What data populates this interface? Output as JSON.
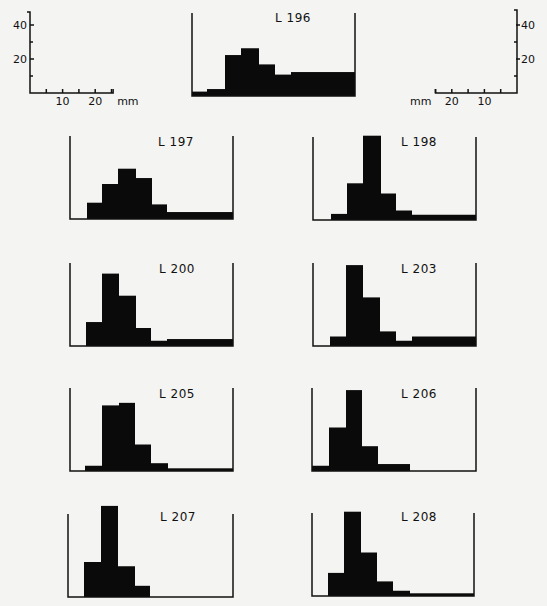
{
  "chart_data": {
    "type": "bar",
    "bin_width_mm": 5,
    "y_unit_px": 1.7,
    "scales": {
      "left": {
        "y_ticks": [
          {
            "value": 40,
            "label": "40"
          },
          {
            "value": 20,
            "label": "20"
          }
        ],
        "y_minor": [
          10,
          30
        ],
        "x_ticks": [
          {
            "value": 10,
            "label": "10"
          },
          {
            "value": 20,
            "label": "20"
          }
        ],
        "x_minor": [
          5,
          15,
          25
        ],
        "x_unit": "mm"
      },
      "right": {
        "y_ticks": [
          {
            "value": 40,
            "label": "40"
          },
          {
            "value": 20,
            "label": "20"
          }
        ],
        "y_minor": [
          10,
          30
        ],
        "x_ticks": [
          {
            "value": 10,
            "label": "10"
          },
          {
            "value": 20,
            "label": "20"
          }
        ],
        "x_minor": [
          5,
          15,
          25
        ],
        "x_unit": "mm"
      }
    },
    "panels": [
      {
        "label": "L 196",
        "frame": [
          192,
          355
        ],
        "baseline": 95,
        "label_xy": [
          275,
          22
        ],
        "bars": [
          {
            "x0": 192,
            "x1": 207,
            "v": 2
          },
          {
            "x0": 207,
            "x1": 225,
            "v": 3.5
          },
          {
            "x0": 225,
            "x1": 241,
            "v": 23.5
          },
          {
            "x0": 241,
            "x1": 259,
            "v": 27.5
          },
          {
            "x0": 259,
            "x1": 275,
            "v": 18
          },
          {
            "x0": 275,
            "x1": 291,
            "v": 12
          },
          {
            "x0": 291,
            "x1": 355,
            "v": 13.5
          }
        ]
      },
      {
        "label": "L 197",
        "frame": [
          70,
          233
        ],
        "baseline": 218,
        "label_xy": [
          158,
          146
        ],
        "bars": [
          {
            "x0": 87,
            "x1": 102,
            "v": 9
          },
          {
            "x0": 102,
            "x1": 118,
            "v": 20
          },
          {
            "x0": 118,
            "x1": 136,
            "v": 29
          },
          {
            "x0": 136,
            "x1": 152,
            "v": 23.5
          },
          {
            "x0": 152,
            "x1": 167,
            "v": 8
          },
          {
            "x0": 167,
            "x1": 233,
            "v": 3.5
          }
        ]
      },
      {
        "label": "L 198",
        "frame": [
          313,
          476
        ],
        "baseline": 219,
        "label_xy": [
          401,
          146
        ],
        "bars": [
          {
            "x0": 331,
            "x1": 347,
            "v": 3
          },
          {
            "x0": 347,
            "x1": 363,
            "v": 21
          },
          {
            "x0": 363,
            "x1": 381,
            "v": 49
          },
          {
            "x0": 381,
            "x1": 396,
            "v": 15
          },
          {
            "x0": 396,
            "x1": 412,
            "v": 5
          },
          {
            "x0": 412,
            "x1": 476,
            "v": 2.5
          }
        ]
      },
      {
        "label": "L 200",
        "frame": [
          70,
          233
        ],
        "baseline": 345,
        "label_xy": [
          159,
          273
        ],
        "bars": [
          {
            "x0": 86,
            "x1": 102,
            "v": 13.5
          },
          {
            "x0": 102,
            "x1": 119,
            "v": 42
          },
          {
            "x0": 119,
            "x1": 136,
            "v": 29
          },
          {
            "x0": 136,
            "x1": 151,
            "v": 10
          },
          {
            "x0": 151,
            "x1": 167,
            "v": 2.5
          },
          {
            "x0": 167,
            "x1": 233,
            "v": 3.5
          }
        ]
      },
      {
        "label": "L 203",
        "frame": [
          313,
          476
        ],
        "baseline": 345,
        "label_xy": [
          401,
          273
        ],
        "bars": [
          {
            "x0": 330,
            "x1": 346,
            "v": 5
          },
          {
            "x0": 346,
            "x1": 363,
            "v": 47
          },
          {
            "x0": 363,
            "x1": 380,
            "v": 28
          },
          {
            "x0": 380,
            "x1": 396,
            "v": 8
          },
          {
            "x0": 396,
            "x1": 412,
            "v": 2.5
          },
          {
            "x0": 412,
            "x1": 476,
            "v": 5
          }
        ]
      },
      {
        "label": "L 205",
        "frame": [
          70,
          233
        ],
        "baseline": 470,
        "label_xy": [
          159,
          398
        ],
        "bars": [
          {
            "x0": 85,
            "x1": 102,
            "v": 2.5
          },
          {
            "x0": 102,
            "x1": 119,
            "v": 38
          },
          {
            "x0": 119,
            "x1": 135,
            "v": 39.5
          },
          {
            "x0": 135,
            "x1": 151,
            "v": 15
          },
          {
            "x0": 151,
            "x1": 168,
            "v": 4
          },
          {
            "x0": 168,
            "x1": 233,
            "v": 1
          }
        ]
      },
      {
        "label": "L 206",
        "frame": [
          312,
          476
        ],
        "baseline": 470,
        "label_xy": [
          401,
          398
        ],
        "bars": [
          {
            "x0": 312,
            "x1": 329,
            "v": 2.5
          },
          {
            "x0": 329,
            "x1": 346,
            "v": 25
          },
          {
            "x0": 346,
            "x1": 362,
            "v": 47
          },
          {
            "x0": 362,
            "x1": 378,
            "v": 14
          },
          {
            "x0": 378,
            "x1": 410,
            "v": 3.5
          }
        ]
      },
      {
        "label": "L 207",
        "frame": [
          68,
          233
        ],
        "baseline": 596,
        "label_xy": [
          160,
          521
        ],
        "bars": [
          {
            "x0": 84,
            "x1": 101,
            "v": 20
          },
          {
            "x0": 101,
            "x1": 118,
            "v": 53
          },
          {
            "x0": 118,
            "x1": 135,
            "v": 17.5
          },
          {
            "x0": 135,
            "x1": 150,
            "v": 6
          }
        ]
      },
      {
        "label": "L 208",
        "frame": [
          312,
          474
        ],
        "baseline": 595,
        "label_xy": [
          401,
          521
        ],
        "bars": [
          {
            "x0": 328,
            "x1": 344,
            "v": 13
          },
          {
            "x0": 344,
            "x1": 361,
            "v": 49
          },
          {
            "x0": 361,
            "x1": 377,
            "v": 25
          },
          {
            "x0": 377,
            "x1": 393,
            "v": 8
          },
          {
            "x0": 393,
            "x1": 410,
            "v": 2.5
          },
          {
            "x0": 410,
            "x1": 474,
            "v": 1
          }
        ]
      }
    ],
    "title": "",
    "xlabel": "mm",
    "ylabel": "",
    "ylim": [
      0,
      50
    ],
    "grid": false,
    "legend": "none"
  }
}
